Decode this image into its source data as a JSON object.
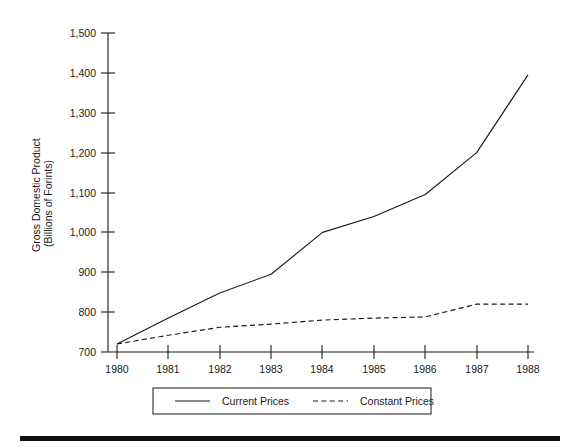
{
  "chart_data": {
    "type": "line",
    "title": "",
    "xlabel": "",
    "ylabel": "Gross Domestic Product (Billions of Forints)",
    "ylabel_line1": "Gross Domestic Product",
    "ylabel_line2": "(Billions of Forints)",
    "categories": [
      "1980",
      "1981",
      "1982",
      "1983",
      "1984",
      "1985",
      "1986",
      "1987",
      "1988"
    ],
    "x": [
      1980,
      1981,
      1982,
      1983,
      1984,
      1985,
      1986,
      1987,
      1988
    ],
    "xlim": [
      1980,
      1988
    ],
    "ylim": [
      700,
      1500
    ],
    "ytick_labels": [
      "1,500",
      "1,400",
      "1,300",
      "1,200",
      "1,100",
      "1,000",
      "900",
      "800",
      "700"
    ],
    "yticks": [
      1500,
      1400,
      1300,
      1200,
      1100,
      1000,
      900,
      800,
      700
    ],
    "grid": false,
    "legend_position": "bottom",
    "series": [
      {
        "name": "Current Prices",
        "style": "solid",
        "values": [
          720,
          785,
          848,
          895,
          1000,
          1040,
          1095,
          1200,
          1395
        ]
      },
      {
        "name": "Constant Prices",
        "style": "dashed",
        "values": [
          720,
          742,
          762,
          770,
          780,
          785,
          788,
          820,
          820
        ]
      }
    ]
  },
  "legend": {
    "entries": [
      {
        "label": "Current Prices",
        "style": "solid"
      },
      {
        "label": "Constant Prices",
        "style": "dashed"
      }
    ]
  },
  "colors": {
    "ink": "#1a1a1a",
    "background": "#ffffff",
    "rule": "#101010"
  }
}
